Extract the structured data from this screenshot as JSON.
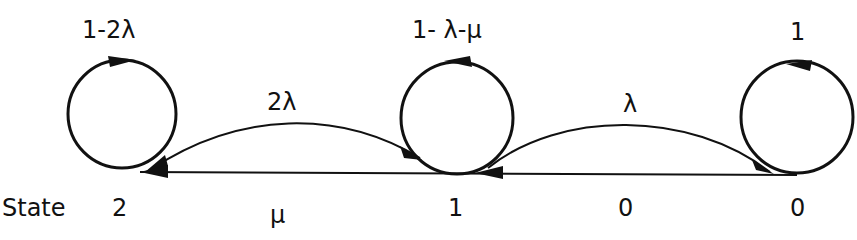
{
  "diagram": {
    "type": "markov-chain-state-transition",
    "state_row_label": "State",
    "states": [
      {
        "id": "2",
        "label": "2",
        "self_loop_label": "1-2λ"
      },
      {
        "id": "1",
        "label": "1",
        "self_loop_label": "1- λ-μ"
      },
      {
        "id": "0",
        "label": "0",
        "self_loop_label": "1"
      }
    ],
    "transitions": [
      {
        "from": "1",
        "to": "2",
        "label": "2λ",
        "shape": "upper-arc"
      },
      {
        "from": "0",
        "to": "1",
        "label": "λ",
        "shape": "upper-arc"
      },
      {
        "from": "1",
        "to": "2",
        "label": "μ",
        "shape": "straight-lower"
      },
      {
        "from": "0",
        "to": "1",
        "label": "0",
        "shape": "straight-lower"
      }
    ],
    "colors": {
      "stroke": "#111111",
      "background": "#ffffff"
    }
  }
}
